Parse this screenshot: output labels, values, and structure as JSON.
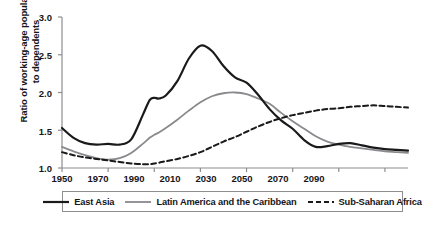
{
  "chart_data": {
    "type": "line",
    "title": "",
    "xlabel": "",
    "ylabel": "Ratio of working-age population to dependents",
    "xlim": [
      1950,
      2100
    ],
    "ylim": [
      1.0,
      3.0
    ],
    "grid": false,
    "legend_position": "bottom",
    "xticks": [
      "1950",
      "1970",
      "1990",
      "2010",
      "2030",
      "2050",
      "2070",
      "2090"
    ],
    "xtick_values": [
      1950,
      1970,
      1990,
      2010,
      2030,
      2050,
      2070,
      2090
    ],
    "yticks": [
      "1.0",
      "1.5",
      "2.0",
      "2.5",
      "3.0"
    ],
    "ytick_values": [
      1.0,
      1.5,
      2.0,
      2.5,
      3.0
    ],
    "x": [
      1950,
      1955,
      1960,
      1965,
      1970,
      1975,
      1980,
      1985,
      1988,
      1990,
      1992,
      1995,
      2000,
      2005,
      2010,
      2015,
      2020,
      2025,
      2030,
      2035,
      2040,
      2045,
      2050,
      2055,
      2060,
      2065,
      2070,
      2075,
      2080,
      2085,
      2090,
      2095,
      2100
    ],
    "series": [
      {
        "name": "East Asia",
        "style": "solid",
        "color": "#1a1a1a",
        "width": 2.2,
        "values": [
          1.53,
          1.4,
          1.33,
          1.31,
          1.32,
          1.31,
          1.38,
          1.7,
          1.9,
          1.93,
          1.92,
          1.96,
          2.15,
          2.45,
          2.62,
          2.55,
          2.35,
          2.2,
          2.13,
          1.97,
          1.78,
          1.63,
          1.52,
          1.37,
          1.28,
          1.29,
          1.32,
          1.33,
          1.3,
          1.27,
          1.25,
          1.24,
          1.23
        ]
      },
      {
        "name": "Latin America and the Caribbean",
        "style": "solid",
        "color": "#8a8a8e",
        "width": 1.8,
        "values": [
          1.28,
          1.22,
          1.17,
          1.13,
          1.11,
          1.13,
          1.2,
          1.32,
          1.4,
          1.44,
          1.47,
          1.53,
          1.64,
          1.76,
          1.87,
          1.95,
          1.99,
          2.0,
          1.98,
          1.92,
          1.85,
          1.73,
          1.62,
          1.52,
          1.42,
          1.35,
          1.31,
          1.28,
          1.26,
          1.24,
          1.22,
          1.21,
          1.2
        ]
      },
      {
        "name": "Sub-Saharan Africa",
        "style": "dashed",
        "color": "#1a1a1a",
        "width": 2.0,
        "values": [
          1.21,
          1.17,
          1.14,
          1.12,
          1.1,
          1.08,
          1.06,
          1.05,
          1.05,
          1.06,
          1.07,
          1.09,
          1.12,
          1.16,
          1.21,
          1.28,
          1.35,
          1.41,
          1.48,
          1.55,
          1.61,
          1.66,
          1.7,
          1.73,
          1.76,
          1.78,
          1.79,
          1.81,
          1.82,
          1.83,
          1.82,
          1.81,
          1.8
        ]
      }
    ]
  },
  "axis": {
    "y_title": "Ratio of working-age population to dependents",
    "ytick_0": "1.0",
    "ytick_1": "1.5",
    "ytick_2": "2.0",
    "ytick_3": "2.5",
    "ytick_4": "3.0",
    "xtick_0": "1950",
    "xtick_1": "1970",
    "xtick_2": "1990",
    "xtick_3": "2010",
    "xtick_4": "2030",
    "xtick_5": "2050",
    "xtick_6": "2070",
    "xtick_7": "2090"
  },
  "legend": {
    "items": [
      {
        "label": "East Asia",
        "style": "solid",
        "color": "#1a1a1a"
      },
      {
        "label": "Latin America and the Caribbean",
        "style": "solid",
        "color": "#8a8a8e"
      },
      {
        "label": "Sub-Saharan Africa",
        "style": "dashed",
        "color": "#1a1a1a"
      }
    ]
  }
}
